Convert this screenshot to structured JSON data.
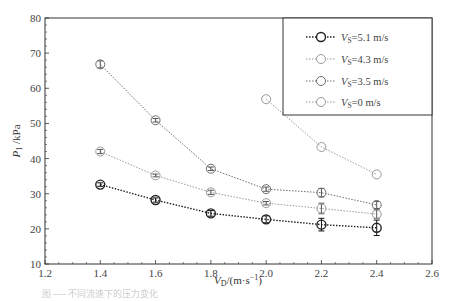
{
  "chart_data": {
    "type": "line",
    "title": "",
    "xlabel": "V_D/(m·s⁻¹)",
    "ylabel": "P_1/kPa",
    "xlim": [
      1.2,
      2.6
    ],
    "ylim": [
      10,
      80
    ],
    "x_ticks": [
      "1.2",
      "1.4",
      "1.6",
      "1.8",
      "2.0",
      "2.2",
      "2.4",
      "2.6"
    ],
    "y_ticks": [
      "10",
      "20",
      "30",
      "40",
      "50",
      "60",
      "70",
      "80"
    ],
    "grid": false,
    "legend_position": "upper right",
    "series": [
      {
        "name": "V_S=5.1 m/s",
        "color": "#222222",
        "x": [
          1.4,
          1.6,
          1.8,
          2.0,
          2.2,
          2.4
        ],
        "values": [
          32.6,
          28.2,
          24.4,
          22.7,
          21.2,
          20.3
        ],
        "error": [
          0.5,
          0.6,
          0.8,
          1.0,
          1.8,
          2.2
        ]
      },
      {
        "name": "V_S=4.3 m/s",
        "color": "#9a9a9a",
        "x": [
          1.4,
          1.6,
          1.8,
          2.0,
          2.2,
          2.4
        ],
        "values": [
          42.0,
          35.2,
          30.4,
          27.3,
          25.8,
          24.2
        ],
        "error": [
          0.6,
          0.4,
          0.6,
          0.5,
          1.5,
          1.2
        ]
      },
      {
        "name": "V_S=3.5 m/s",
        "color": "#6e6e6e",
        "x": [
          1.4,
          1.6,
          1.8,
          2.0,
          2.2,
          2.4
        ],
        "values": [
          66.8,
          50.9,
          37.1,
          31.3,
          30.3,
          26.8
        ],
        "error": [
          1.0,
          0.5,
          0.5,
          0.6,
          1.2,
          1.0
        ]
      },
      {
        "name": "V_S=0 m/s",
        "color": "#9a9a9a",
        "x": [
          2.0,
          2.2,
          2.4
        ],
        "values": [
          56.9,
          43.3,
          35.5
        ],
        "error": [
          0,
          0,
          0
        ]
      }
    ]
  },
  "legend": {
    "items": [
      {
        "prefix": "V",
        "sub": "S",
        "value": "=5.1 m/s"
      },
      {
        "prefix": "V",
        "sub": "S",
        "value": "=4.3 m/s"
      },
      {
        "prefix": "V",
        "sub": "S",
        "value": "=3.5 m/s"
      },
      {
        "prefix": "V",
        "sub": "S",
        "value": "=0 m/s"
      }
    ]
  },
  "axes": {
    "x_label_main": "V",
    "x_label_sub": "D",
    "x_label_rest": "/(m·s",
    "x_label_sup": "−1",
    "x_label_close": ")",
    "y_label_main": "P",
    "y_label_sub": "1",
    "y_label_rest": " /kPa"
  },
  "caption": "图 ── 不同流速下的压力变化"
}
